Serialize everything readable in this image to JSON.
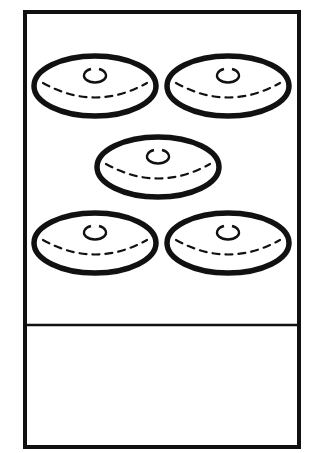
{
  "card": {
    "title": "",
    "answer_text": "",
    "count_hint": 5
  },
  "colors": {
    "ink": "#111111",
    "background": "#ffffff"
  },
  "buns": [
    {
      "name": "bun-top-left",
      "cx": 95,
      "cy": 86
    },
    {
      "name": "bun-top-right",
      "cx": 228,
      "cy": 86
    },
    {
      "name": "bun-center",
      "cx": 158,
      "cy": 167
    },
    {
      "name": "bun-bottom-left",
      "cx": 95,
      "cy": 243
    },
    {
      "name": "bun-bottom-right",
      "cx": 228,
      "cy": 243
    }
  ]
}
